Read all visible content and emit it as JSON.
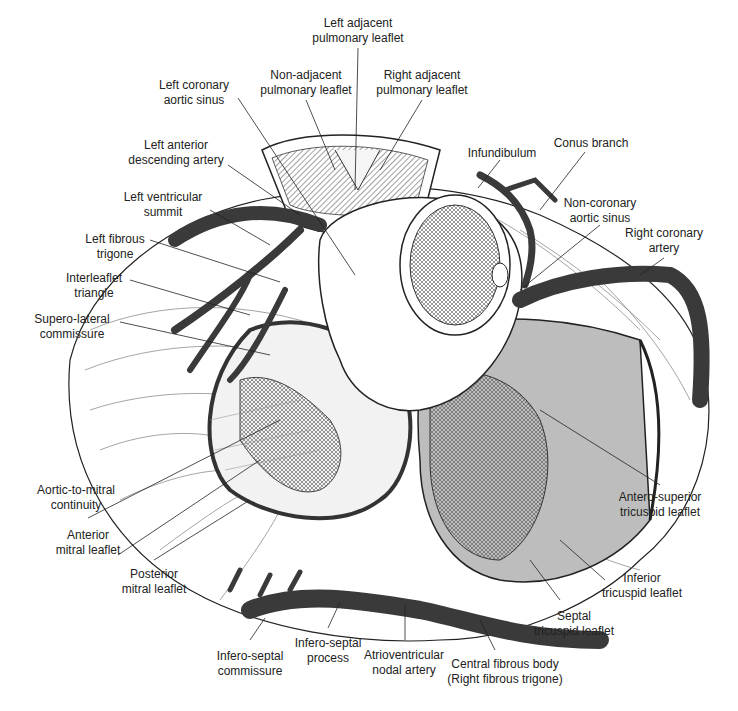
{
  "diagram": {
    "colors": {
      "line": "#222222",
      "artery": "#3a3a3a",
      "mitral_fill": "#f2f2f2",
      "tricuspid_fill": "#bdbdbd",
      "background": "#ffffff"
    },
    "labels": [
      {
        "id": "left-adjacent-pulmonary-leaflet",
        "text": "Left adjacent\npulmonary leaflet",
        "x": 358,
        "y": 16
      },
      {
        "id": "non-adjacent-pulmonary-leaflet",
        "text": "Non-adjacent\npulmonary leaflet",
        "x": 306,
        "y": 68
      },
      {
        "id": "right-adjacent-pulmonary-leaflet",
        "text": "Right adjacent\npulmonary leaflet",
        "x": 422,
        "y": 68
      },
      {
        "id": "left-coronary-aortic-sinus",
        "text": "Left coronary\naortic sinus",
        "x": 194,
        "y": 78
      },
      {
        "id": "left-anterior-descending-artery",
        "text": "Left anterior\ndescending artery",
        "x": 176,
        "y": 138
      },
      {
        "id": "infundibulum",
        "text": "Infundibulum",
        "x": 502,
        "y": 146
      },
      {
        "id": "conus-branch",
        "text": "Conus branch",
        "x": 591,
        "y": 136
      },
      {
        "id": "non-coronary-aortic-sinus",
        "text": "Non-coronary\naortic sinus",
        "x": 600,
        "y": 196
      },
      {
        "id": "left-ventricular-summit",
        "text": "Left ventricular\nsummit",
        "x": 163,
        "y": 190
      },
      {
        "id": "right-coronary-artery",
        "text": "Right coronary\nartery",
        "x": 664,
        "y": 226
      },
      {
        "id": "left-fibrous-trigone",
        "text": "Left fibrous\ntrigone",
        "x": 115,
        "y": 232
      },
      {
        "id": "interleaflet-triangle",
        "text": "Interleaflet\ntriangle",
        "x": 94,
        "y": 271
      },
      {
        "id": "supero-lateral-commissure",
        "text": "Supero-lateral\ncommissure",
        "x": 72,
        "y": 312
      },
      {
        "id": "aortic-to-mitral-continuity",
        "text": "Aortic-to-mitral\ncontinuity",
        "x": 76,
        "y": 483
      },
      {
        "id": "anterior-mitral-leaflet",
        "text": "Anterior\nmitral leaflet",
        "x": 88,
        "y": 528
      },
      {
        "id": "posterior-mitral-leaflet",
        "text": "Posterior\nmitral leaflet",
        "x": 154,
        "y": 567
      },
      {
        "id": "antero-superior-tricuspid-leaflet",
        "text": "Antero-superior\ntricuspid leaflet",
        "x": 660,
        "y": 490
      },
      {
        "id": "inferior-tricuspid-leaflet",
        "text": "Inferior\ntricuspid leaflet",
        "x": 642,
        "y": 571
      },
      {
        "id": "septal-tricuspid-leaflet",
        "text": "Septal\ntricuspid leaflet",
        "x": 574,
        "y": 609
      },
      {
        "id": "infero-septal-commissure",
        "text": "Infero-septal\ncommissure",
        "x": 250,
        "y": 649
      },
      {
        "id": "infero-septal-process",
        "text": "Infero-septal\nprocess",
        "x": 328,
        "y": 636
      },
      {
        "id": "atrioventricular-nodal-artery",
        "text": "Atrioventricular\nnodal artery",
        "x": 404,
        "y": 648
      },
      {
        "id": "central-fibrous-body",
        "text": "Central fibrous body\n(Right fibrous trigone)",
        "x": 505,
        "y": 657
      }
    ]
  }
}
